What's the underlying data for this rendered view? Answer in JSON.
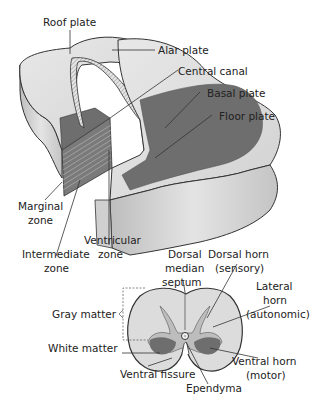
{
  "diagram": {
    "colors": {
      "white_matter_light": "#dcdcdc",
      "white_matter_mid": "#c8c8c8",
      "gray_plate_dark": "#6e6e6e",
      "gray_matter_light": "#bdbdbd",
      "outline": "#333333",
      "ependyma_stripe": "#a8a8a8"
    },
    "block_labels": {
      "roof_plate": "Roof plate",
      "alar_plate": "Alar plate",
      "central_canal": "Central canal",
      "basal_plate": "Basal plate",
      "floor_plate": "Floor plate",
      "marginal_zone_1": "Marginal",
      "marginal_zone_2": "zone",
      "intermediate_zone_1": "Intermediate",
      "intermediate_zone_2": "zone",
      "ventricular_zone_1": "Ventricular",
      "ventricular_zone_2": "zone"
    },
    "cross_section_labels": {
      "dorsal_median_septum_1": "Dorsal",
      "dorsal_median_septum_2": "median",
      "dorsal_median_septum_3": "septum",
      "dorsal_horn_1": "Dorsal horn",
      "dorsal_horn_2": "(sensory)",
      "lateral_horn_1": "Lateral",
      "lateral_horn_2": "horn",
      "lateral_horn_3": "(autonomic)",
      "gray_matter": "Gray matter",
      "white_matter": "White matter",
      "ventral_fissure": "Ventral fissure",
      "ependyma": "Ependyma",
      "ventral_horn_1": "Ventral horn",
      "ventral_horn_2": "(motor)"
    }
  }
}
